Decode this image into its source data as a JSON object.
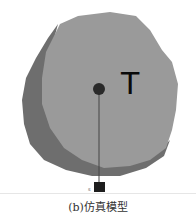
{
  "figure": {
    "target_label": "T",
    "sensor_label": "s",
    "caption": "(b)仿真模型",
    "colors": {
      "shadow_body": "#6e6e6e",
      "front_body": "#9a9a9a",
      "center_dot": "#2a2a2a",
      "line": "#444444",
      "sensor": "#1e1e1e"
    }
  }
}
